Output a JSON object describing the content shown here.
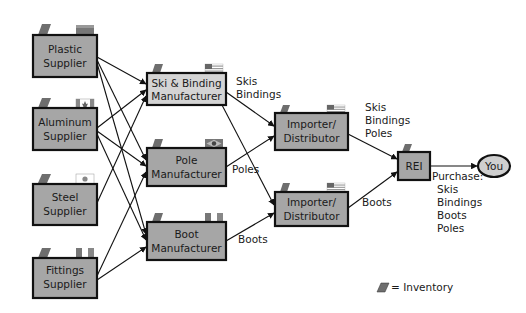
{
  "colors": {
    "box_fill": "#a6a6a6",
    "box_fill_light": "#d4d4d4",
    "box_stroke": "#111111",
    "tab": "#6e6e6e",
    "arrow": "#111111",
    "you_fill": "#cfcfcf"
  },
  "nodes": {
    "plastic": {
      "line1": "Plastic",
      "line2": "Supplier",
      "flag": "unknown-flag"
    },
    "aluminum": {
      "line1": "Aluminum",
      "line2": "Supplier",
      "flag": "canada-flag"
    },
    "steel": {
      "line1": "Steel",
      "line2": "Supplier",
      "flag": "japan-flag"
    },
    "fittings": {
      "line1": "Fittings",
      "line2": "Supplier",
      "flag": "italy-flag"
    },
    "ski_binding": {
      "line1": "Ski & Binding",
      "line2": "Manufacturer",
      "flag": "usa-flag"
    },
    "pole": {
      "line1": "Pole",
      "line2": "Manufacturer",
      "flag": "brazil-flag"
    },
    "boot": {
      "line1": "Boot",
      "line2": "Manufacturer",
      "flag": "italy-flag"
    },
    "importer1": {
      "line1": "Importer/",
      "line2": "Distributor",
      "flag": "usa-flag"
    },
    "importer2": {
      "line1": "Importer/",
      "line2": "Distributor",
      "flag": "usa-flag"
    },
    "rei": {
      "label": "REI"
    },
    "you": {
      "label": "You"
    }
  },
  "edge_labels": {
    "ski_to_imp1": [
      "Skis",
      "Bindings"
    ],
    "pole_to_imp": "Poles",
    "boot_to_imp2": "Boots",
    "imp1_to_rei": [
      "Skis",
      "Bindings",
      "Poles"
    ],
    "imp2_to_rei": "Boots",
    "purchase_title": "Purchase:",
    "purchase_items": [
      "Skis",
      "Bindings",
      "Boots",
      "Poles"
    ]
  },
  "legend": {
    "text": "= Inventory",
    "icon": "inventory-icon"
  }
}
